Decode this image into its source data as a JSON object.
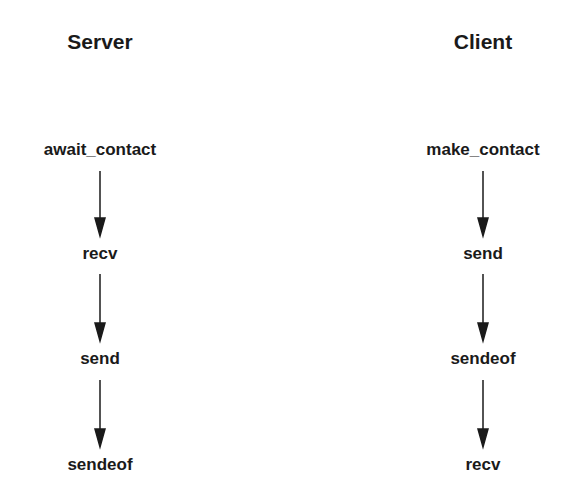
{
  "columns": [
    {
      "title": "Server",
      "steps": [
        "await_contact",
        "recv",
        "send",
        "sendeof"
      ]
    },
    {
      "title": "Client",
      "steps": [
        "make_contact",
        "send",
        "sendeof",
        "recv"
      ]
    }
  ]
}
